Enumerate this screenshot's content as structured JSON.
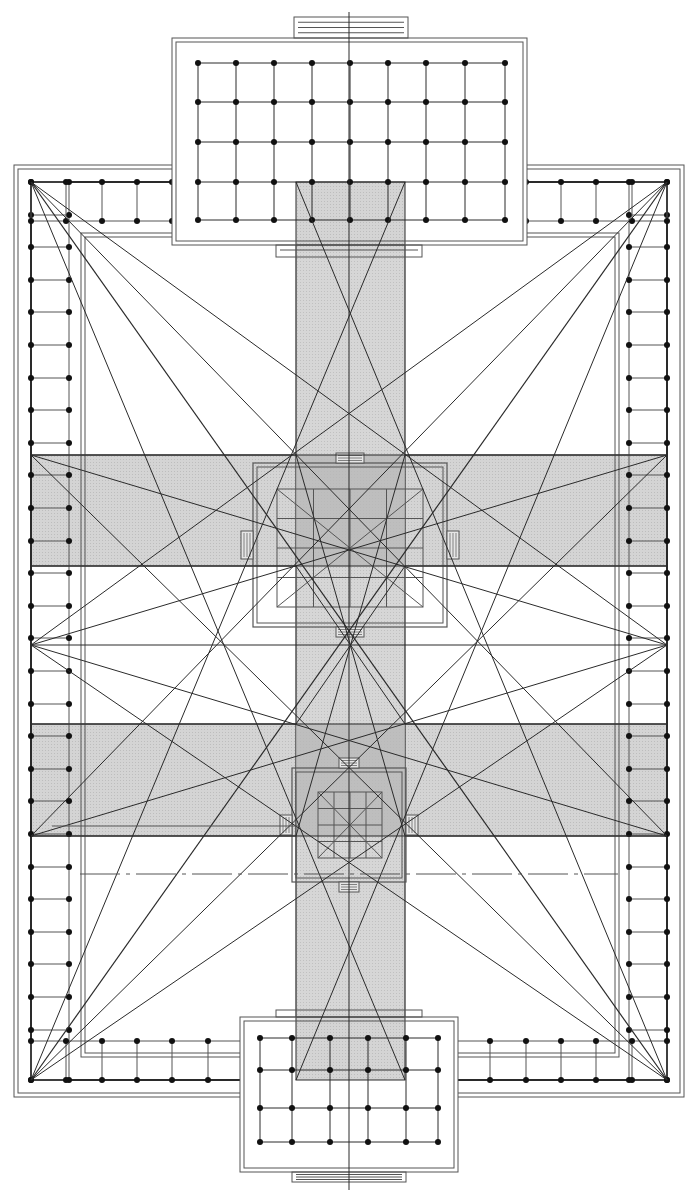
{
  "diagram": {
    "type": "architectural-plan",
    "canvas": {
      "width": 698,
      "height": 1202
    },
    "colors": {
      "line": "#2a2a2a",
      "thin_line": "#555555",
      "band_fill": "#cfcfcf",
      "overlap_fill": "#b8b8b8",
      "background": "#ffffff"
    },
    "center_axis_x": 349,
    "outer_frame": {
      "x1": 14,
      "y1": 165,
      "x2": 684,
      "y2": 1097
    },
    "colonnade": {
      "outer": {
        "x1": 31,
        "y1": 182,
        "x2": 667,
        "y2": 1080
      },
      "inner": {
        "x1": 69,
        "y1": 221,
        "x2": 629,
        "y2": 1041
      },
      "spacing": 32.6
    },
    "inner_court": {
      "x1": 81,
      "y1": 233,
      "x2": 619,
      "y2": 1057
    },
    "top_building": {
      "frame": {
        "x1": 172,
        "y1": 38,
        "x2": 527,
        "y2": 245
      },
      "grid_cols": [
        198,
        236,
        274,
        312,
        350,
        388,
        426,
        465,
        505
      ],
      "grid_rows": [
        63,
        102,
        142,
        182,
        220
      ],
      "stair": {
        "x1": 294,
        "y1": 17,
        "x2": 408,
        "y2": 38
      }
    },
    "bottom_building": {
      "frame": {
        "x1": 240,
        "y1": 1017,
        "x2": 458,
        "y2": 1172
      },
      "grid_cols": [
        260,
        292,
        330,
        368,
        406,
        438
      ],
      "grid_rows": [
        1038,
        1070,
        1108,
        1142
      ],
      "stair": {
        "x1": 292,
        "y1": 1172,
        "x2": 406,
        "y2": 1182
      }
    },
    "vertical_band": {
      "x1": 296,
      "y1": 182,
      "x2": 405,
      "y2": 1080
    },
    "horizontal_bands": [
      {
        "y1": 455,
        "y2": 566
      },
      {
        "y1": 724,
        "y2": 836
      }
    ],
    "upper_pavilion": {
      "outer": {
        "x1": 253,
        "y1": 463,
        "x2": 447,
        "y2": 627
      },
      "inner": {
        "x1": 277,
        "y1": 489,
        "x2": 423,
        "y2": 607
      }
    },
    "lower_pavilion": {
      "outer": {
        "x1": 292,
        "y1": 768,
        "x2": 406,
        "y2": 882
      },
      "inner": {
        "x1": 318,
        "y1": 792,
        "x2": 382,
        "y2": 858
      }
    },
    "annotations": []
  }
}
